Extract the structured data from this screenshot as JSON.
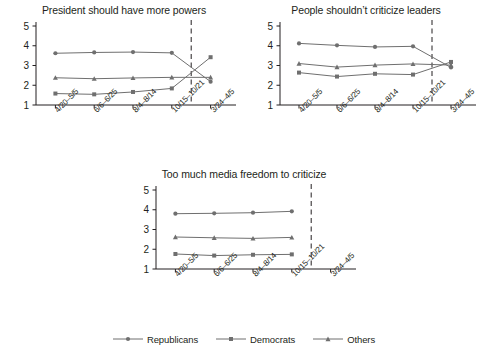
{
  "figure": {
    "width": 488,
    "height": 357,
    "background": "#ffffff",
    "ink_color": "#231f20",
    "series_color": "#6f6f6f"
  },
  "legend": {
    "position": "bottom-center",
    "items": [
      {
        "label": "Republicans",
        "marker": "circle",
        "color": "#6f6f6f"
      },
      {
        "label": "Democrats",
        "marker": "square",
        "color": "#6f6f6f"
      },
      {
        "label": "Others",
        "marker": "triangle",
        "color": "#6f6f6f"
      }
    ]
  },
  "chart_data": [
    {
      "type": "line",
      "title": "President should have more powers",
      "xlabel": "",
      "ylabel": "",
      "ylim": [
        1,
        5
      ],
      "yticks": [
        1,
        2,
        3,
        4,
        5
      ],
      "grid": false,
      "categories": [
        "4/20–5/5",
        "6/6–6/25",
        "8/4–8/14",
        "10/15–10/21",
        "3/24–4/5"
      ],
      "annotations": [
        {
          "type": "vline",
          "style": "dashed",
          "between": [
            "10/15–10/21",
            "3/24–4/5"
          ]
        }
      ],
      "series": [
        {
          "name": "Republicans",
          "marker": "circle",
          "values": [
            3.62,
            3.66,
            3.68,
            3.64,
            2.18
          ]
        },
        {
          "name": "Democrats",
          "marker": "square",
          "values": [
            1.58,
            1.54,
            1.66,
            1.84,
            3.42
          ]
        },
        {
          "name": "Others",
          "marker": "triangle",
          "values": [
            2.38,
            2.33,
            2.37,
            2.4,
            2.4
          ]
        }
      ]
    },
    {
      "type": "line",
      "title": "People shouldn’t criticize leaders",
      "xlabel": "",
      "ylabel": "",
      "ylim": [
        1,
        5
      ],
      "yticks": [
        1,
        2,
        3,
        4,
        5
      ],
      "grid": false,
      "categories": [
        "4/20–5/5",
        "6/6–6/25",
        "8/4–8/14",
        "10/15–10/21",
        "3/24–4/5"
      ],
      "annotations": [
        {
          "type": "vline",
          "style": "dashed",
          "between": [
            "10/15–10/21",
            "3/24–4/5"
          ]
        }
      ],
      "series": [
        {
          "name": "Republicans",
          "marker": "circle",
          "values": [
            4.12,
            4.02,
            3.94,
            3.97,
            2.9
          ]
        },
        {
          "name": "Democrats",
          "marker": "square",
          "values": [
            2.64,
            2.44,
            2.58,
            2.54,
            3.18
          ]
        },
        {
          "name": "Others",
          "marker": "triangle",
          "values": [
            3.1,
            2.92,
            3.02,
            3.08,
            3.02
          ]
        }
      ]
    },
    {
      "type": "line",
      "title": "Too much media freedom to criticize",
      "xlabel": "",
      "ylabel": "",
      "ylim": [
        1,
        5
      ],
      "yticks": [
        1,
        2,
        3,
        4,
        5
      ],
      "grid": false,
      "categories": [
        "4/20–5/5",
        "6/6–6/25",
        "8/4–8/14",
        "10/15–10/21",
        "3/24–4/5"
      ],
      "annotations": [
        {
          "type": "vline",
          "style": "dashed",
          "between": [
            "10/15–10/21",
            "3/24–4/5"
          ]
        }
      ],
      "series": [
        {
          "name": "Republicans",
          "marker": "circle",
          "values": [
            3.8,
            3.82,
            3.85,
            3.92,
            null
          ]
        },
        {
          "name": "Democrats",
          "marker": "square",
          "values": [
            1.76,
            1.68,
            1.72,
            1.74,
            null
          ]
        },
        {
          "name": "Others",
          "marker": "triangle",
          "values": [
            2.62,
            2.58,
            2.55,
            2.6,
            null
          ]
        }
      ]
    }
  ]
}
